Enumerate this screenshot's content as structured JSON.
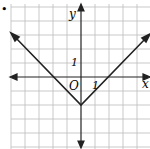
{
  "bullet": "•",
  "axes": {
    "x_label": "x",
    "y_label": "y",
    "origin_label": "O",
    "x_tick_label": "1",
    "y_tick_label": "1"
  },
  "graph": {
    "function": "y = |x| - 2",
    "vertex": [
      0,
      -2
    ],
    "grid_range_x": [
      -5,
      5
    ],
    "grid_range_y": [
      -4,
      5
    ]
  }
}
